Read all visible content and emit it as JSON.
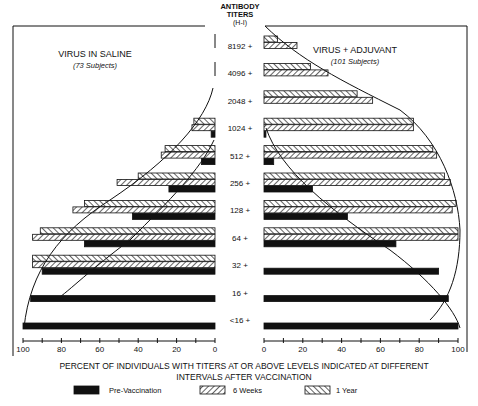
{
  "chart_data": {
    "type": "bar",
    "orientation": "horizontal",
    "layout": "back-to-back",
    "title": "",
    "center_axis_label": [
      "ANTIBODY",
      "TITERS",
      "(H-I)"
    ],
    "categories": [
      "8192 +",
      "4096 +",
      "2048 +",
      "1024 +",
      "512 +",
      "256 +",
      "128 +",
      "64 +",
      "32 +",
      "16 +",
      "<16 +"
    ],
    "xlabel": [
      "PERCENT OF INDIVIDUALS WITH TITERS AT OR ABOVE LEVELS INDICATED AT DIFFERENT",
      "INTERVALS AFTER VACCINATION"
    ],
    "xlim": [
      0,
      100
    ],
    "x_ticks": [
      0,
      20,
      40,
      60,
      80,
      100
    ],
    "grid": false,
    "legend_position": "bottom",
    "legend": [
      {
        "key": "pre",
        "label": "Pre-Vaccination",
        "pattern": "solid-black"
      },
      {
        "key": "w6",
        "label": "6 Weeks",
        "pattern": "hatch-forward"
      },
      {
        "key": "y1",
        "label": "1 Year",
        "pattern": "hatch-back"
      }
    ],
    "panels": [
      {
        "side": "left",
        "title": "VIRUS IN SALINE",
        "subtitle": "(73 Subjects)",
        "series": [
          {
            "name": "1 Year",
            "values": [
              null,
              null,
              null,
              11,
              26,
              40,
              68,
              91,
              95,
              null,
              null
            ]
          },
          {
            "name": "6 Weeks",
            "values": [
              null,
              null,
              null,
              12,
              28,
              51,
              74,
              95,
              95,
              null,
              null
            ]
          },
          {
            "name": "Pre-Vaccination",
            "values": [
              null,
              null,
              null,
              2,
              7,
              24,
              43,
              68,
              90,
              96,
              100
            ]
          }
        ]
      },
      {
        "side": "right",
        "title": "VIRUS + ADJUVANT",
        "subtitle": "(101 Subjects)",
        "series": [
          {
            "name": "1 Year",
            "values": [
              7,
              24,
              48,
              77,
              87,
              93,
              99,
              100,
              null,
              null,
              null
            ]
          },
          {
            "name": "6 Weeks",
            "values": [
              17,
              33,
              56,
              77,
              89,
              96,
              97,
              100,
              null,
              null,
              null
            ]
          },
          {
            "name": "Pre-Vaccination",
            "values": [
              null,
              null,
              null,
              1,
              5,
              25,
              43,
              68,
              90,
              95,
              100
            ]
          }
        ]
      }
    ]
  }
}
